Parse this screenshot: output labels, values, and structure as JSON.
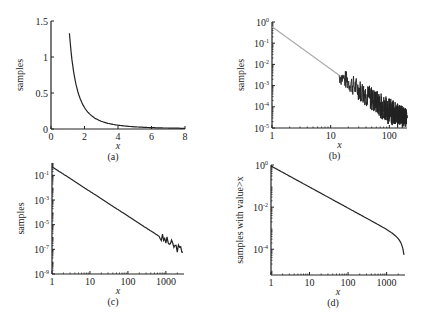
{
  "colors": {
    "axis": "#222222",
    "line": "#222222",
    "line_light": "#aaaaaa",
    "background": "#ffffff"
  },
  "chart_data": [
    {
      "id": "a",
      "type": "line",
      "panel_label": "(a)",
      "xlabel": "x",
      "ylabel": "samples",
      "xlim": [
        0,
        8
      ],
      "ylim": [
        0,
        1.5
      ],
      "xticks": [
        "0",
        "2",
        "4",
        "6",
        "8"
      ],
      "yticks": [
        "0",
        "0.5",
        "1",
        "1.5"
      ],
      "scale": "linear",
      "series": [
        {
          "name": "power-law pdf",
          "x": [
            1.1,
            1.3,
            1.5,
            1.75,
            2,
            2.5,
            3,
            3.5,
            4,
            5,
            6,
            7,
            8
          ],
          "values": [
            1.33,
            0.85,
            0.58,
            0.38,
            0.26,
            0.14,
            0.085,
            0.055,
            0.038,
            0.02,
            0.012,
            0.008,
            0.005
          ]
        }
      ]
    },
    {
      "id": "b",
      "type": "line",
      "panel_label": "(b)",
      "xlabel": "x",
      "ylabel": "samples",
      "xlim": [
        1,
        200
      ],
      "ylim": [
        1e-05,
        1
      ],
      "xticks": [
        "1",
        "10",
        "100"
      ],
      "yticks": [
        "10^0",
        "10^-1",
        "10^-2",
        "10^-3",
        "10^-4",
        "10^-5"
      ],
      "scale": "log-log",
      "series": [
        {
          "name": "histogram (linear bins)",
          "x": [
            1,
            10,
            20,
            50,
            100,
            200
          ],
          "values": [
            0.6,
            0.006,
            0.0015,
            0.0001,
            2e-05,
            1e-05
          ],
          "note": "noisy tail beyond x≈20"
        }
      ]
    },
    {
      "id": "c",
      "type": "line",
      "panel_label": "(c)",
      "xlabel": "x",
      "ylabel": "samples",
      "xlim": [
        1,
        3000
      ],
      "ylim": [
        1e-09,
        1
      ],
      "xticks": [
        "1",
        "10",
        "100",
        "1000"
      ],
      "yticks": [
        "10^-1",
        "10^-3",
        "10^-5",
        "10^-7",
        "10^-9"
      ],
      "scale": "log-log",
      "series": [
        {
          "name": "histogram (log bins)",
          "x": [
            1,
            10,
            100,
            300,
            1000,
            1500,
            2000,
            3000
          ],
          "values": [
            0.5,
            0.005,
            5e-05,
            5e-06,
            4e-07,
            1e-07,
            6e-08,
            1e-07
          ]
        }
      ]
    },
    {
      "id": "d",
      "type": "line",
      "panel_label": "(d)",
      "xlabel": "x",
      "ylabel": "samples with value>x",
      "xlim": [
        1,
        3000
      ],
      "ylim": [
        6e-06,
        1
      ],
      "xticks": [
        "1",
        "10",
        "100",
        "1000"
      ],
      "yticks": [
        "10^0",
        "10^-2",
        "10^-4"
      ],
      "scale": "log-log",
      "series": [
        {
          "name": "cumulative distribution",
          "x": [
            1,
            10,
            100,
            1000,
            2000,
            3000
          ],
          "values": [
            0.9,
            0.1,
            0.01,
            0.0011,
            3e-05,
            6e-06
          ]
        }
      ]
    }
  ]
}
